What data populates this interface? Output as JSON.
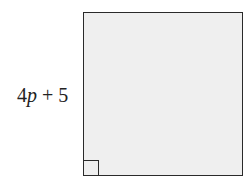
{
  "diagram": {
    "shape": "square",
    "fill_color": "#efefef",
    "stroke_color": "#2a2a2a",
    "side_label": {
      "coefficient": "4",
      "variable": "p",
      "rest": " + 5",
      "full": "4p + 5"
    },
    "right_angle_marker": "bottom-left"
  }
}
